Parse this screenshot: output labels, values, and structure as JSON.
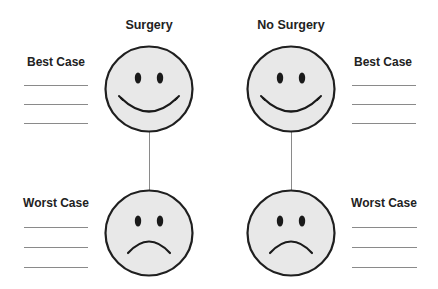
{
  "columns": [
    {
      "title": "Surgery"
    },
    {
      "title": "No Surgery"
    }
  ],
  "labels": {
    "best_case": "Best Case",
    "worst_case": "Worst Case"
  },
  "faces": {
    "best": {
      "expression": "smiling-face-icon"
    },
    "worst": {
      "expression": "frowning-face-icon"
    }
  },
  "colors": {
    "face_fill": "#e8e8e8",
    "face_stroke": "#1f1f1f",
    "line": "#8a8a8a"
  },
  "blank_lines_per_case": 3
}
